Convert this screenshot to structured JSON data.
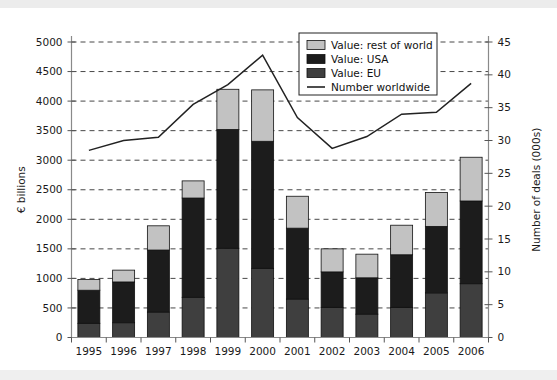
{
  "chart_data": {
    "type": "bar",
    "title": "",
    "subtitle": "",
    "xlabel": "",
    "ylabel": "€ billions",
    "y2label": "Number of deals (000s)",
    "categories": [
      "1995",
      "1996",
      "1997",
      "1998",
      "1999",
      "2000",
      "2001",
      "2002",
      "2003",
      "2004",
      "2005",
      "2006"
    ],
    "ylim": [
      0,
      5000
    ],
    "y2lim": [
      0,
      45
    ],
    "yticks": [
      "0",
      "500",
      "1000",
      "1500",
      "2000",
      "2500",
      "3000",
      "3500",
      "4000",
      "4500",
      "5000"
    ],
    "y2ticks": [
      "0",
      "5",
      "10",
      "15",
      "20",
      "25",
      "30",
      "35",
      "40",
      "45"
    ],
    "grid": "horizontal-dashed",
    "legend_position": "top-right-inside",
    "stacked": true,
    "series": [
      {
        "name": "Value: EU",
        "type": "bar",
        "color": "#3f3f3f",
        "axis": "left",
        "values": [
          240,
          250,
          430,
          680,
          1510,
          1170,
          650,
          510,
          395,
          510,
          755,
          910
        ]
      },
      {
        "name": "Value: USA",
        "type": "bar",
        "color": "#1c1c1c",
        "axis": "left",
        "values": [
          560,
          690,
          1050,
          1680,
          2010,
          2150,
          1200,
          600,
          615,
          890,
          1125,
          1400
        ]
      },
      {
        "name": "Value: rest of world",
        "type": "bar",
        "color": "#c2c2c2",
        "axis": "left",
        "values": [
          180,
          200,
          410,
          290,
          680,
          870,
          540,
          390,
          400,
          500,
          575,
          740
        ]
      },
      {
        "name": "Number worldwide",
        "type": "line",
        "color": "#222222",
        "axis": "right",
        "values": [
          28.5,
          30.0,
          30.5,
          35.5,
          38.5,
          43.0,
          33.5,
          28.8,
          30.6,
          34.0,
          34.3,
          38.7
        ]
      }
    ],
    "stack_totals": [
      980,
      1140,
      1890,
      2650,
      4200,
      4190,
      2390,
      1500,
      1410,
      1900,
      2455,
      3050
    ]
  },
  "legend": {
    "items": [
      {
        "label": "Value: rest of world",
        "swatch": "#c2c2c2"
      },
      {
        "label": "Value: USA",
        "swatch": "#1c1c1c"
      },
      {
        "label": "Value: EU",
        "swatch": "#3f3f3f"
      },
      {
        "label": "Number worldwide",
        "swatch": "line"
      }
    ]
  },
  "colors": {
    "rest_of_world": "#c2c2c2",
    "usa": "#1c1c1c",
    "eu": "#3f3f3f",
    "line": "#222222",
    "background": "#ffffff",
    "page_background": "#f2f2f2",
    "grid": "#333333",
    "axis": "#8a8a8a"
  }
}
